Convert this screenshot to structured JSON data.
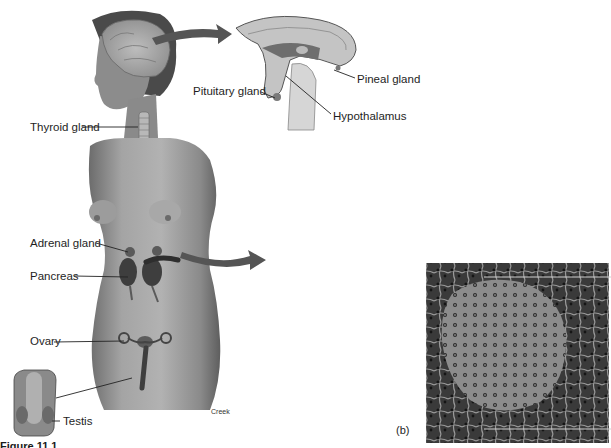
{
  "figure": {
    "labels": {
      "pituitary": "Pituitary gland",
      "pineal": "Pineal gland",
      "hypothalamus": "Hypothalamus",
      "thyroid": "Thyroid gland",
      "adrenal": "Adrenal gland",
      "pancreas": "Pancreas",
      "ovary": "Ovary",
      "testis": "Testis",
      "artist": "Creek",
      "part_b": "(b)"
    },
    "caption_partial": "Figure 11.1",
    "colors": {
      "arrow": "#555555",
      "skin": "#9a9a9a",
      "skin_shadow": "#6e6e6e",
      "brain": "#c8c8c8",
      "micrograph_dark": "#2e2e2e",
      "micrograph_light": "#8a8a8a",
      "leader_line": "#222222"
    }
  }
}
